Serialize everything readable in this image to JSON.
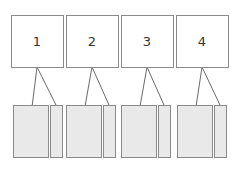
{
  "colors": {
    "background": "#ffffff",
    "box_fill": "#ffffff",
    "box_stroke": "#8a8a8a",
    "part_fill": "#e9e9e9",
    "part_stroke": "#8a8a8a",
    "line": "#6a6a6a"
  },
  "nodes": [
    {
      "label": "1",
      "x": 11,
      "y": 15,
      "w": 52,
      "h": 52,
      "parts": [
        {
          "x": 13,
          "y": 105,
          "w": 35,
          "h": 52
        },
        {
          "x": 50,
          "y": 105,
          "w": 12,
          "h": 52
        }
      ]
    },
    {
      "label": "2",
      "x": 66,
      "y": 15,
      "w": 52,
      "h": 52,
      "parts": [
        {
          "x": 66,
          "y": 105,
          "w": 35,
          "h": 52
        },
        {
          "x": 103,
          "y": 105,
          "w": 12,
          "h": 52
        }
      ]
    },
    {
      "label": "3",
      "x": 121,
      "y": 15,
      "w": 52,
      "h": 52,
      "parts": [
        {
          "x": 121,
          "y": 105,
          "w": 35,
          "h": 52
        },
        {
          "x": 158,
          "y": 105,
          "w": 12,
          "h": 52
        }
      ]
    },
    {
      "label": "4",
      "x": 176,
      "y": 15,
      "w": 52,
      "h": 52,
      "parts": [
        {
          "x": 177,
          "y": 105,
          "w": 35,
          "h": 52
        },
        {
          "x": 214,
          "y": 105,
          "w": 12,
          "h": 52
        }
      ]
    }
  ]
}
